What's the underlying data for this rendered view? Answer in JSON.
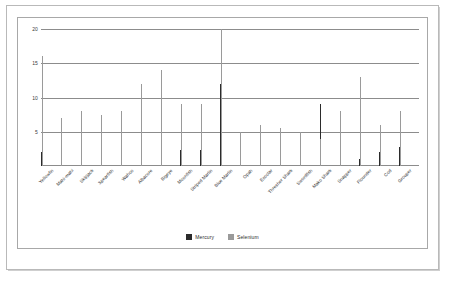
{
  "chart_data": {
    "type": "bar",
    "title": "",
    "xlabel": "",
    "ylabel": "",
    "ylim": [
      0,
      20
    ],
    "yticks": [
      5,
      10,
      15,
      20
    ],
    "grid": true,
    "legend_position": "bottom-center",
    "categories": [
      "Yellowfin",
      "Mahi-mahi",
      "Skipjack",
      "Spearfish",
      "Wahoo",
      "Albacore",
      "Bigeye",
      "Moonfish",
      "Striped Marlin",
      "Blue Marlin",
      "Opah",
      "Escolar",
      "Thresher Shark",
      "Swordfish",
      "Mako Shark",
      "Snapper",
      "Flounder",
      "Cod",
      "Grouper"
    ],
    "series": [
      {
        "name": "Mercury",
        "color": "#2b2b2b",
        "values": [
          2.0,
          1.0,
          2.0,
          1.4,
          1.0,
          2.8,
          3.5,
          2.4,
          2.4,
          12.0,
          3.4,
          3.9,
          4.5,
          5.0,
          9.0,
          2.0,
          1.0,
          2.0,
          2.8
        ]
      },
      {
        "name": "Selenium",
        "color": "#9a9a9a",
        "values": [
          16.0,
          7.0,
          8.0,
          7.5,
          8.0,
          12.0,
          14.0,
          9.0,
          9.0,
          20.0,
          5.0,
          6.0,
          5.5,
          5.0,
          4.0,
          8.0,
          13.0,
          6.0,
          8.0
        ]
      }
    ]
  },
  "legend": {
    "items": [
      {
        "label": "Mercury",
        "color": "#2b2b2b"
      },
      {
        "label": "Selenium",
        "color": "#9a9a9a"
      }
    ]
  }
}
